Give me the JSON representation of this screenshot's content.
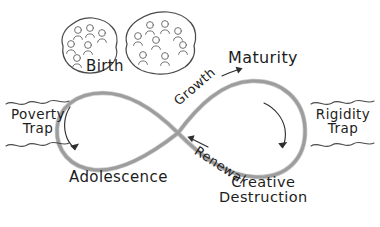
{
  "diagram": {
    "background_color": "#ffffff",
    "curve_color": "#9d9d9d",
    "ink_color": "#2e2e2e",
    "labels": {
      "birth": "Birth",
      "maturity": "Maturity",
      "adolescence": "Adolescence",
      "creative_destruction_line1": "Creative",
      "creative_destruction_line2": "Destruction",
      "poverty_trap_line1": "Poverty",
      "poverty_trap_line2": "Trap",
      "rigidity_trap_line1": "Rigidity",
      "rigidity_trap_line2": "Trap",
      "growth": "Growth",
      "renewal": "Renewal"
    },
    "groups": {
      "left_blob_people_count": 6,
      "right_blob_people_count": 8
    },
    "arrows": {
      "growth_direction": "up-right",
      "renewal_direction": "up-left",
      "left_loop_rotation": "clockwise",
      "right_loop_rotation": "clockwise"
    }
  }
}
